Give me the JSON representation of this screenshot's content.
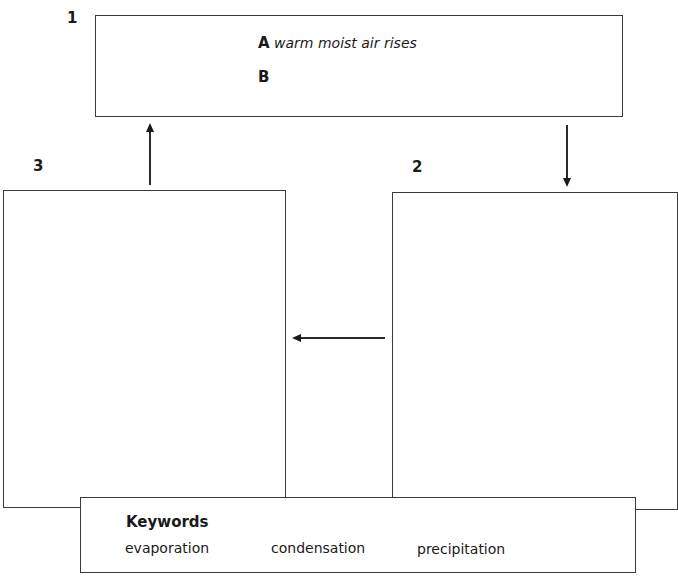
{
  "diagram": {
    "stages": [
      {
        "number": "1"
      },
      {
        "number": "2"
      },
      {
        "number": "3"
      }
    ],
    "box1": {
      "items": [
        {
          "letter": "A",
          "text": "warm moist air rises"
        },
        {
          "letter": "B",
          "text": ""
        }
      ]
    },
    "keywords": {
      "title": "Keywords",
      "words": [
        "evaporation",
        "condensation",
        "precipitation"
      ]
    },
    "arrows": [
      {
        "from": "1",
        "to": "2",
        "direction": "down"
      },
      {
        "from": "2",
        "to": "3",
        "direction": "left"
      },
      {
        "from": "3",
        "to": "1",
        "direction": "up"
      }
    ]
  }
}
